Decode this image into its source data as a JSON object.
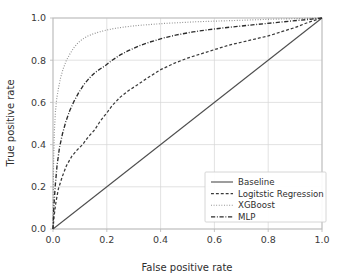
{
  "chart_data": {
    "type": "line",
    "title": "",
    "xlabel": "False positive rate",
    "ylabel": "True positive rate",
    "xlim": [
      0.0,
      1.0
    ],
    "ylim": [
      0.0,
      1.0
    ],
    "grid": true,
    "legend_position": "lower right",
    "xticks": [
      "0.0",
      "0.2",
      "0.4",
      "0.6",
      "0.8",
      "1.0"
    ],
    "xtick_values": [
      0.0,
      0.2,
      0.4,
      0.6,
      0.8,
      1.0
    ],
    "yticks": [
      "0.0",
      "0.2",
      "0.4",
      "0.6",
      "0.8",
      "1.0"
    ],
    "ytick_values": [
      0.0,
      0.2,
      0.4,
      0.6,
      0.8,
      1.0
    ],
    "series": [
      {
        "name": "Baseline",
        "linestyle": "solid",
        "color": "#4d4d4d",
        "width": 1.1,
        "x": [
          0.0,
          1.0
        ],
        "y": [
          0.0,
          1.0
        ]
      },
      {
        "name": "Logitstic Regression",
        "linestyle": "dashed",
        "color": "#3a3a3a",
        "width": 1.25,
        "x": [
          0.0,
          0.004,
          0.01,
          0.02,
          0.035,
          0.05,
          0.07,
          0.09,
          0.11,
          0.13,
          0.155,
          0.175,
          0.19,
          0.2,
          0.22,
          0.25,
          0.28,
          0.31,
          0.35,
          0.4,
          0.45,
          0.5,
          0.55,
          0.6,
          0.65,
          0.7,
          0.75,
          0.8,
          0.85,
          0.9,
          0.95,
          1.0
        ],
        "y": [
          0.0,
          0.06,
          0.12,
          0.19,
          0.25,
          0.3,
          0.345,
          0.375,
          0.4,
          0.435,
          0.47,
          0.51,
          0.535,
          0.55,
          0.585,
          0.625,
          0.655,
          0.68,
          0.715,
          0.755,
          0.785,
          0.81,
          0.83,
          0.85,
          0.87,
          0.885,
          0.9,
          0.915,
          0.935,
          0.955,
          0.98,
          1.0
        ]
      },
      {
        "name": "XGBoost",
        "linestyle": "dotted",
        "color": "#8a8a8a",
        "width": 1.15,
        "x": [
          0.0,
          0.002,
          0.005,
          0.009,
          0.014,
          0.02,
          0.028,
          0.038,
          0.05,
          0.063,
          0.078,
          0.095,
          0.11,
          0.13,
          0.15,
          0.175,
          0.2,
          0.23,
          0.27,
          0.31,
          0.36,
          0.41,
          0.47,
          0.53,
          0.6,
          0.67,
          0.74,
          0.81,
          0.88,
          0.94,
          1.0
        ],
        "y": [
          0.0,
          0.3,
          0.46,
          0.555,
          0.62,
          0.665,
          0.715,
          0.76,
          0.8,
          0.83,
          0.86,
          0.885,
          0.9,
          0.915,
          0.925,
          0.935,
          0.943,
          0.951,
          0.958,
          0.964,
          0.969,
          0.974,
          0.978,
          0.982,
          0.985,
          0.988,
          0.991,
          0.994,
          0.996,
          0.998,
          1.0
        ]
      },
      {
        "name": "MLP",
        "linestyle": "dashdot",
        "color": "#2b2b2b",
        "width": 1.35,
        "x": [
          0.0,
          0.003,
          0.008,
          0.015,
          0.024,
          0.035,
          0.048,
          0.062,
          0.078,
          0.095,
          0.115,
          0.135,
          0.155,
          0.175,
          0.195,
          0.22,
          0.25,
          0.28,
          0.32,
          0.36,
          0.41,
          0.46,
          0.52,
          0.58,
          0.64,
          0.7,
          0.76,
          0.82,
          0.88,
          0.94,
          1.0
        ],
        "y": [
          0.0,
          0.1,
          0.2,
          0.3,
          0.385,
          0.45,
          0.51,
          0.56,
          0.605,
          0.645,
          0.685,
          0.715,
          0.74,
          0.758,
          0.775,
          0.8,
          0.825,
          0.845,
          0.868,
          0.886,
          0.905,
          0.92,
          0.934,
          0.945,
          0.954,
          0.962,
          0.97,
          0.977,
          0.985,
          0.992,
          1.0
        ]
      }
    ]
  },
  "legend": {
    "entries": [
      {
        "label": "Baseline"
      },
      {
        "label": "Logitstic Regression"
      },
      {
        "label": "XGBoost"
      },
      {
        "label": "MLP"
      }
    ]
  }
}
